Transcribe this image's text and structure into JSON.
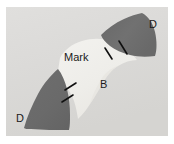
{
  "figure": {
    "kind": "micrograph",
    "width_px": 174,
    "height_px": 144,
    "image_area": {
      "left": 6,
      "top": 7,
      "width": 162,
      "height": 129
    },
    "background_color": "#dededd",
    "page_color": "#ffffff"
  },
  "labels": {
    "mark": "Mark",
    "b": "B",
    "d_top_right": "D",
    "d_bottom_left": "D"
  },
  "regions": [
    {
      "id": "dark-wedge-top-right",
      "label": "D",
      "fill": "#6e6e6e",
      "description": "upper-right dark wedge"
    },
    {
      "id": "dark-wedge-bottom-left",
      "label": "D",
      "fill": "#6e6e6e",
      "description": "lower-left dark wedge"
    },
    {
      "id": "bright-band",
      "label": "Mark",
      "fill": "#f3f2ef",
      "description": "bright curved band between the two dark wedges"
    },
    {
      "id": "matrix-background",
      "label": "B",
      "fill": "#dededd",
      "description": "light gray matrix background"
    }
  ],
  "leader_lines": [
    {
      "id": "leader-mark-inner",
      "points": "106,52 99,42"
    },
    {
      "id": "leader-mark-outer",
      "points": "121,48 113,35"
    },
    {
      "id": "leader-b-upper",
      "points": "62,82 72,76"
    },
    {
      "id": "leader-b-lower",
      "points": "59,94 69,88"
    }
  ],
  "colors": {
    "dark_phase": "#6e6e6e",
    "bright_phase": "#f3f2ef",
    "matrix": "#dededd",
    "leader_line": "#111111",
    "text": "#1a1a1a"
  }
}
